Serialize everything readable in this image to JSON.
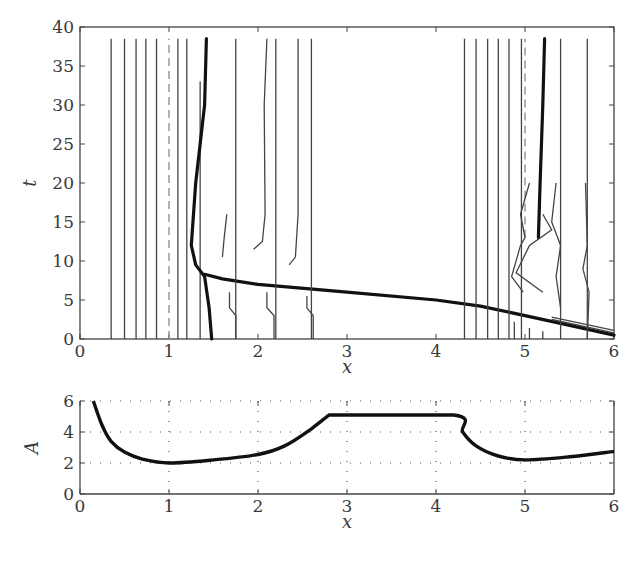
{
  "chart_data": [
    {
      "type": "line",
      "name": "characteristics-plot",
      "title": "",
      "xlabel": "x",
      "ylabel": "t",
      "xlim": [
        0,
        6
      ],
      "ylim": [
        0,
        40
      ],
      "xticks": [
        "0",
        "1",
        "2",
        "3",
        "4",
        "5",
        "6"
      ],
      "yticks": [
        "0",
        "5",
        "10",
        "15",
        "20",
        "25",
        "30",
        "35",
        "40"
      ],
      "grid": false,
      "description": "Contour/characteristic lines in the x-t plane: vertical characteristics on the left (x≈0.35–1.3) and right (x≈4.3–5.2), a dashed line at x≈1 and x≈5.0, a thick shock curve starting at x≈1.5 at t=0, bending at t≈8 and running to x≈5.4 at t≈2, plus a thick curve near x≈5.2 from t≈13 to t≈38.",
      "series": [
        {
          "name": "thin-vertical-left",
          "x": [
            0.35,
            0.5,
            0.63,
            0.74,
            0.86,
            1.1,
            1.2
          ],
          "t_range": [
            0,
            38.5
          ]
        },
        {
          "name": "dashed-left",
          "x": [
            1.0
          ],
          "t_range": [
            0,
            38.5
          ]
        },
        {
          "name": "thin-vertical-left-short",
          "x": [
            1.35
          ],
          "t_range": [
            0,
            33
          ]
        },
        {
          "name": "shock-left",
          "points": [
            [
              1.48,
              0
            ],
            [
              1.45,
              4
            ],
            [
              1.4,
              8
            ],
            [
              1.3,
              9.5
            ],
            [
              1.25,
              12
            ],
            [
              1.3,
              20
            ],
            [
              1.4,
              30
            ],
            [
              1.42,
              38.5
            ]
          ]
        },
        {
          "name": "shock-main",
          "points": [
            [
              1.4,
              8.3
            ],
            [
              1.6,
              7.7
            ],
            [
              2.0,
              7.0
            ],
            [
              3.0,
              6.0
            ],
            [
              4.0,
              5.0
            ],
            [
              4.5,
              4.2
            ],
            [
              5.0,
              3.0
            ],
            [
              5.4,
              2.0
            ],
            [
              6.0,
              0.5
            ]
          ]
        },
        {
          "name": "thin-vertical-mid",
          "x": [
            1.75,
            2.2,
            2.6
          ],
          "t_range": [
            0,
            38.5
          ]
        },
        {
          "name": "thin-vertical-right",
          "x": [
            4.32,
            4.45,
            4.58,
            4.7,
            4.82,
            4.96
          ],
          "t_range": [
            0,
            38.5
          ]
        },
        {
          "name": "dashed-right",
          "x": [
            5.0
          ],
          "t_range": [
            13,
            38.5
          ]
        },
        {
          "name": "shock-right",
          "points": [
            [
              5.15,
              13
            ],
            [
              5.17,
              20
            ],
            [
              5.2,
              30
            ],
            [
              5.22,
              38.5
            ]
          ]
        },
        {
          "name": "thin-vertical-far-right",
          "x": [
            5.4,
            5.7
          ],
          "t_range": [
            0,
            38.5
          ]
        }
      ]
    },
    {
      "type": "line",
      "name": "amplitude-plot",
      "title": "",
      "xlabel": "x",
      "ylabel": "A",
      "xlim": [
        0,
        6
      ],
      "ylim": [
        0,
        6
      ],
      "xticks": [
        "0",
        "1",
        "2",
        "3",
        "4",
        "5",
        "6"
      ],
      "yticks": [
        "0",
        "2",
        "4",
        "6"
      ],
      "grid": true,
      "grid_style": "dotted",
      "series": [
        {
          "name": "A(x)",
          "points": [
            [
              0.15,
              6.0
            ],
            [
              0.25,
              4.4
            ],
            [
              0.35,
              3.4
            ],
            [
              0.5,
              2.7
            ],
            [
              0.7,
              2.25
            ],
            [
              1.0,
              2.0
            ],
            [
              1.5,
              2.2
            ],
            [
              2.0,
              2.55
            ],
            [
              2.3,
              3.1
            ],
            [
              2.6,
              4.2
            ],
            [
              2.8,
              5.1
            ],
            [
              4.2,
              5.1
            ],
            [
              4.3,
              4.0
            ],
            [
              4.45,
              3.1
            ],
            [
              4.7,
              2.45
            ],
            [
              5.0,
              2.2
            ],
            [
              5.5,
              2.4
            ],
            [
              6.0,
              2.75
            ]
          ]
        }
      ]
    }
  ],
  "labels": {
    "top_xlabel": "x",
    "top_ylabel": "t",
    "bottom_xlabel": "x",
    "bottom_ylabel": "A"
  }
}
